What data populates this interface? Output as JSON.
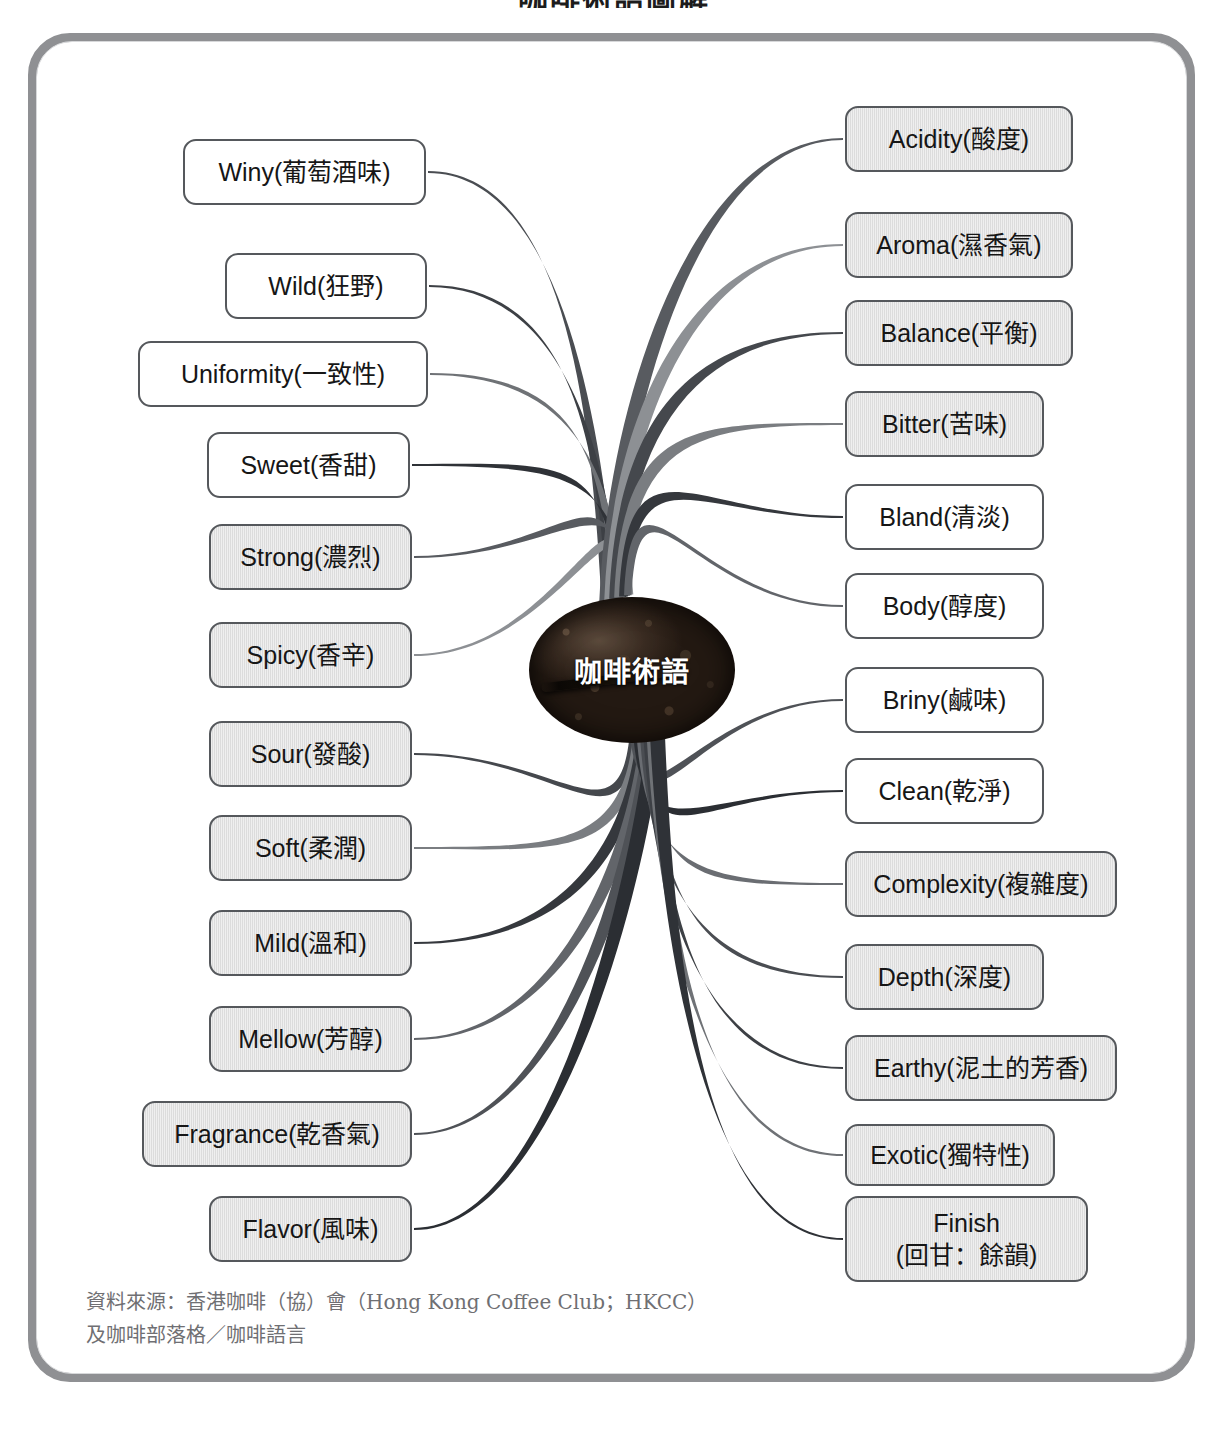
{
  "title": "咖啡術語圖解",
  "center": {
    "label": "咖啡術語",
    "icon": "coffee-bean-icon"
  },
  "colors": {
    "frame": "#8f9093",
    "node_border": "#55585c",
    "node_shaded_fill": "#dcdcdc",
    "node_light_fill": "#ffffff",
    "bean_dark": "#1b130d",
    "source_text": "#6f6f73"
  },
  "left_column": [
    {
      "label": "Winy(葡萄酒味)",
      "fill": "light",
      "x": 183,
      "y": 139,
      "w": 243,
      "h": 66
    },
    {
      "label": "Wild(狂野)",
      "fill": "light",
      "x": 225,
      "y": 253,
      "w": 202,
      "h": 66
    },
    {
      "label": "Uniformity(一致性)",
      "fill": "light",
      "x": 138,
      "y": 341,
      "w": 290,
      "h": 66
    },
    {
      "label": "Sweet(香甜)",
      "fill": "light",
      "x": 207,
      "y": 432,
      "w": 203,
      "h": 66
    },
    {
      "label": "Strong(濃烈)",
      "fill": "shade",
      "x": 209,
      "y": 524,
      "w": 203,
      "h": 66
    },
    {
      "label": "Spicy(香辛)",
      "fill": "shade",
      "x": 209,
      "y": 622,
      "w": 203,
      "h": 66
    },
    {
      "label": "Sour(發酸)",
      "fill": "shade",
      "x": 209,
      "y": 721,
      "w": 203,
      "h": 66
    },
    {
      "label": "Soft(柔潤)",
      "fill": "shade",
      "x": 209,
      "y": 815,
      "w": 203,
      "h": 66
    },
    {
      "label": "Mild(溫和)",
      "fill": "shade",
      "x": 209,
      "y": 910,
      "w": 203,
      "h": 66
    },
    {
      "label": "Mellow(芳醇)",
      "fill": "shade",
      "x": 209,
      "y": 1006,
      "w": 203,
      "h": 66
    },
    {
      "label": "Fragrance(乾香氣)",
      "fill": "shade",
      "x": 142,
      "y": 1101,
      "w": 270,
      "h": 66
    },
    {
      "label": "Flavor(風味)",
      "fill": "shade",
      "x": 209,
      "y": 1196,
      "w": 203,
      "h": 66
    }
  ],
  "right_column": [
    {
      "label": "Acidity(酸度)",
      "fill": "shade",
      "x": 845,
      "y": 106,
      "w": 228,
      "h": 66
    },
    {
      "label": "Aroma(濕香氣)",
      "fill": "shade",
      "x": 845,
      "y": 212,
      "w": 228,
      "h": 66
    },
    {
      "label": "Balance(平衡)",
      "fill": "shade",
      "x": 845,
      "y": 300,
      "w": 228,
      "h": 66
    },
    {
      "label": "Bitter(苦味)",
      "fill": "shade",
      "x": 845,
      "y": 391,
      "w": 199,
      "h": 66
    },
    {
      "label": "Bland(清淡)",
      "fill": "light",
      "x": 845,
      "y": 484,
      "w": 199,
      "h": 66
    },
    {
      "label": "Body(醇度)",
      "fill": "light",
      "x": 845,
      "y": 573,
      "w": 199,
      "h": 66
    },
    {
      "label": "Briny(鹹味)",
      "fill": "light",
      "x": 845,
      "y": 667,
      "w": 199,
      "h": 66
    },
    {
      "label": "Clean(乾淨)",
      "fill": "light",
      "x": 845,
      "y": 758,
      "w": 199,
      "h": 66
    },
    {
      "label": "Complexity(複雜度)",
      "fill": "shade",
      "x": 845,
      "y": 851,
      "w": 272,
      "h": 66
    },
    {
      "label": "Depth(深度)",
      "fill": "shade",
      "x": 845,
      "y": 944,
      "w": 199,
      "h": 66
    },
    {
      "label": "Earthy(泥土的芳香)",
      "fill": "shade",
      "x": 845,
      "y": 1035,
      "w": 272,
      "h": 66
    },
    {
      "label": "Exotic(獨特性)",
      "fill": "shade",
      "x": 845,
      "y": 1124,
      "w": 210,
      "h": 62
    },
    {
      "label": "Finish\n(回甘：餘韻)",
      "fill": "shade",
      "x": 845,
      "y": 1196,
      "w": 243,
      "h": 86,
      "line1": "Finish",
      "line2": "(回甘：餘韻)"
    }
  ],
  "source": {
    "line1": "資料來源：香港咖啡（協）會（Hong Kong Coffee Club；HKCC）",
    "line2": "及咖啡部落格／咖啡語言"
  }
}
